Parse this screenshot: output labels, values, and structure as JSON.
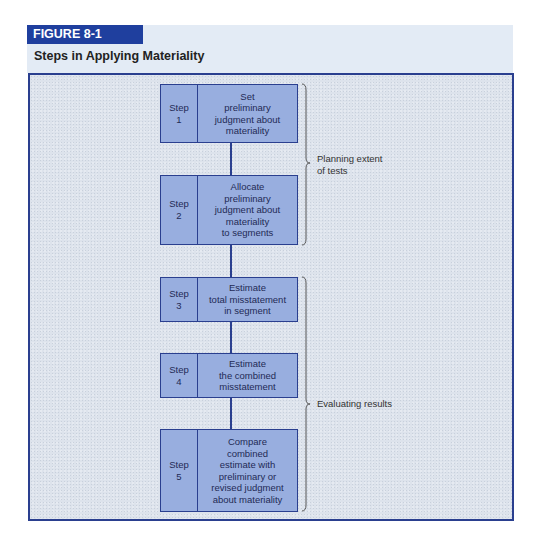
{
  "figure": {
    "tag": "FIGURE 8-1",
    "title": "Steps in Applying Materiality"
  },
  "steps": [
    {
      "label": "Step",
      "number": "1",
      "text": "Set\npreliminary\njudgment about\nmateriality"
    },
    {
      "label": "Step",
      "number": "2",
      "text": "Allocate\npreliminary\njudgment about\nmateriality\nto segments"
    },
    {
      "label": "Step",
      "number": "3",
      "text": "Estimate\ntotal misstatement\nin segment"
    },
    {
      "label": "Step",
      "number": "4",
      "text": "Estimate\nthe combined\nmisstatement"
    },
    {
      "label": "Step",
      "number": "5",
      "text": "Compare\ncombined\nestimate with\npreliminary or\nrevised judgment\nabout materiality"
    }
  ],
  "groups": [
    {
      "label": "Planning extent\nof tests",
      "steps": [
        1,
        2
      ]
    },
    {
      "label": "Evaluating results",
      "steps": [
        3,
        4,
        5
      ]
    }
  ],
  "colors": {
    "tag_bg": "#1f3f9e",
    "header_bg": "#e3ebf5",
    "frame_border": "#2a3f8f",
    "step_fill": "#98aedf",
    "panel_bg": "#dde3ec"
  }
}
